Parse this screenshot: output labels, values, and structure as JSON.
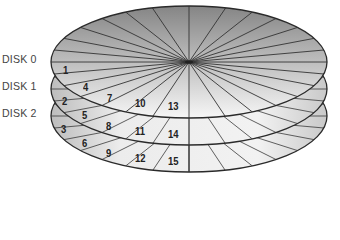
{
  "diagram": {
    "type": "stacked-disk-platters",
    "disks": [
      {
        "label": "DISK 0",
        "label_x": 2,
        "label_y": 53,
        "center_y": 62
      },
      {
        "label": "DISK 1",
        "label_x": 2,
        "label_y": 80,
        "center_y": 89
      },
      {
        "label": "DISK 2",
        "label_x": 2,
        "label_y": 107,
        "center_y": 116
      }
    ],
    "sectors": [
      {
        "num": "1",
        "x": 63,
        "y": 64
      },
      {
        "num": "2",
        "x": 62,
        "y": 95
      },
      {
        "num": "3",
        "x": 61,
        "y": 123
      },
      {
        "num": "4",
        "x": 83,
        "y": 81
      },
      {
        "num": "5",
        "x": 82,
        "y": 109
      },
      {
        "num": "6",
        "x": 82,
        "y": 137
      },
      {
        "num": "7",
        "x": 107,
        "y": 92
      },
      {
        "num": "8",
        "x": 106,
        "y": 120
      },
      {
        "num": "9",
        "x": 106,
        "y": 147
      },
      {
        "num": "10",
        "x": 135,
        "y": 97
      },
      {
        "num": "11",
        "x": 135,
        "y": 125
      },
      {
        "num": "12",
        "x": 135,
        "y": 152
      },
      {
        "num": "13",
        "x": 168,
        "y": 100
      },
      {
        "num": "14",
        "x": 168,
        "y": 128
      },
      {
        "num": "15",
        "x": 168,
        "y": 155
      }
    ],
    "colors": {
      "outline": "#2a2a2a",
      "spoke": "#3a3a3a",
      "fill_dark": "#8c8c8c",
      "fill_light": "#f4f4f4",
      "text": "#222222",
      "label": "#444444"
    }
  }
}
